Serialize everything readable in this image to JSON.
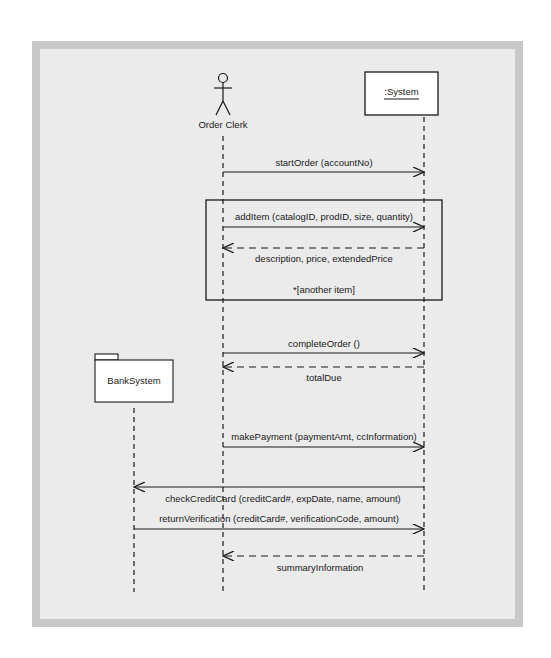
{
  "diagram": {
    "type": "UML sequence diagram",
    "colors": {
      "frame": "#c8c8c8",
      "background": "#ebebeb",
      "line": "#1a1a1a",
      "box_fill": "#ffffff"
    },
    "participants": [
      {
        "id": "order-clerk",
        "kind": "actor",
        "label": "Order Clerk",
        "x": 223
      },
      {
        "id": "system",
        "kind": "object",
        "label": ":System",
        "x": 424
      },
      {
        "id": "bank-system",
        "kind": "package",
        "label": "BankSystem",
        "x": 134
      }
    ],
    "loop_fragment": {
      "guard": "*[another item]"
    },
    "messages": [
      {
        "label": "startOrder (accountNo)",
        "from": "order-clerk",
        "to": "system",
        "style": "sync"
      },
      {
        "label": "addItem (catalogID, prodID, size, quantity)",
        "from": "order-clerk",
        "to": "system",
        "style": "sync"
      },
      {
        "label": "description, price, extendedPrice",
        "from": "system",
        "to": "order-clerk",
        "style": "return"
      },
      {
        "label": "completeOrder ()",
        "from": "order-clerk",
        "to": "system",
        "style": "sync"
      },
      {
        "label": "totalDue",
        "from": "system",
        "to": "order-clerk",
        "style": "return"
      },
      {
        "label": "makePayment (paymentAmt, ccInformation)",
        "from": "order-clerk",
        "to": "system",
        "style": "sync"
      },
      {
        "label": "checkCreditCard (creditCard#, expDate, name, amount)",
        "from": "system",
        "to": "bank-system",
        "style": "sync"
      },
      {
        "label": "returnVerification (creditCard#, verificationCode, amount)",
        "from": "bank-system",
        "to": "system",
        "style": "sync"
      },
      {
        "label": "summaryInformation",
        "from": "system",
        "to": "order-clerk",
        "style": "return"
      }
    ]
  }
}
